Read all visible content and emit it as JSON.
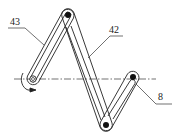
{
  "diagram": {
    "type": "linkage-mechanism",
    "colors": {
      "stroke": "#222222",
      "background": "#ffffff"
    },
    "labels": [
      {
        "id": "43",
        "text": "43"
      },
      {
        "id": "42",
        "text": "42"
      },
      {
        "id": "8",
        "text": "8"
      }
    ],
    "pivots": [
      "top-pivot",
      "left-pivot",
      "bottom-pivot",
      "right-pivot"
    ],
    "centerline": "dash-dot axis",
    "rotation_indicator": "counter-clockwise arrow at left pivot"
  }
}
